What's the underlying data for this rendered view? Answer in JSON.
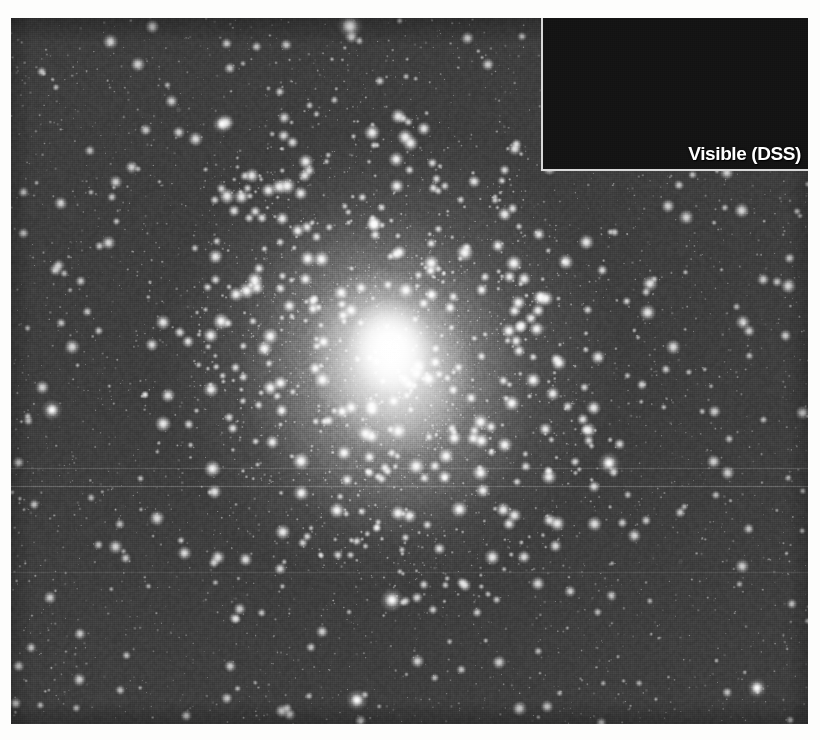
{
  "figure": {
    "kind": "astronomical-plate",
    "colorspace": "grayscale",
    "page_background": "#ffffff",
    "margins": {
      "left": 11,
      "top": 18,
      "right": 12,
      "bottom": 16
    }
  },
  "main_image": {
    "name": "infrared-star-cluster-field",
    "x": 11,
    "y": 18,
    "width": 797,
    "height": 706,
    "background_color": "#3b3b3b",
    "core_color": "#ffffff",
    "core_center": {
      "x": 383,
      "y": 333
    },
    "core_tilt_deg": -22,
    "notes": "Dense field of thousands of resolved, slightly blurred stars; bright diffuse cluster glow elongated NE-SW through the center.",
    "artifacts": [
      {
        "name": "scanline-upper",
        "y": 468,
        "opacity": 0.16
      },
      {
        "name": "scanline-main",
        "y": 486,
        "opacity": 0.22
      },
      {
        "name": "scanline-lower",
        "y": 572,
        "opacity": 0.1
      }
    ]
  },
  "inset": {
    "name": "visible-light-comparison-inset",
    "label": "Visible (DSS)",
    "label_color": "#ffffff",
    "border_color": "#d8d8d8",
    "background_color": "#141414",
    "x": 543,
    "y": 18,
    "width": 265,
    "height": 169,
    "notes": "Darker optical-wavelength view of the same field showing far fewer, sharper point sources and no bright cluster core."
  },
  "star_field": {
    "main": {
      "star_count": 1500,
      "bright_star_count": 120,
      "min_radius_px": 1.1,
      "max_radius_px": 8.5,
      "blur_px": 1.6,
      "color": "#ffffff"
    },
    "inset": {
      "star_count": 430,
      "min_radius_px": 0.7,
      "max_radius_px": 3.2,
      "blur_px": 0.5,
      "color": "#ffffff"
    },
    "named_bright_stars": [
      {
        "name": "bright-star-top-center",
        "x": 350,
        "y": 26,
        "radius": 8.0
      },
      {
        "name": "bright-star-upper-left",
        "x": 222,
        "y": 124,
        "radius": 6.0
      },
      {
        "name": "bright-star-left-mid",
        "x": 52,
        "y": 410,
        "radius": 6.5
      },
      {
        "name": "bright-star-right-mid",
        "x": 609,
        "y": 463,
        "radius": 7.0
      },
      {
        "name": "bright-star-lower-mid",
        "x": 392,
        "y": 600,
        "radius": 7.5
      },
      {
        "name": "bright-star-bottom",
        "x": 357,
        "y": 700,
        "radius": 6.8
      },
      {
        "name": "bright-star-far-right",
        "x": 757,
        "y": 688,
        "radius": 6.2
      },
      {
        "name": "inset-bright-star",
        "x": 665,
        "y": 157,
        "radius": 4.5
      }
    ]
  }
}
